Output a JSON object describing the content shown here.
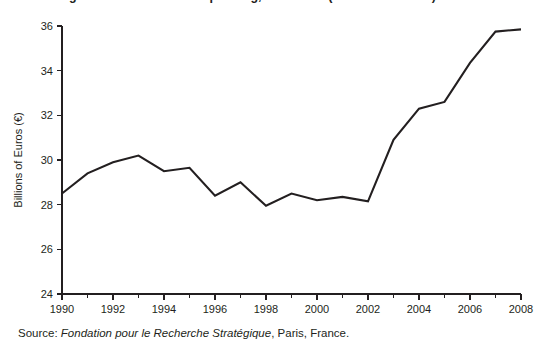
{
  "figure": {
    "title_partial": "Figure: French Defence Spending, 1990-2008 (Billions of Euros)",
    "background_color": "#ffffff",
    "line_color": "#231f20",
    "axis_color": "#231f20"
  },
  "source": {
    "label": "Source: ",
    "organization": "Fondation pour le Recherche Stratégique",
    "place": ", Paris, France."
  },
  "chart_data": {
    "type": "line",
    "title": "",
    "xlabel": "",
    "ylabel": "Billions of Euros (€)",
    "xlim": [
      1990,
      2008
    ],
    "ylim": [
      24,
      36
    ],
    "grid": false,
    "legend": false,
    "x_ticks_major": [
      1990,
      1992,
      1994,
      1996,
      1998,
      2000,
      2002,
      2004,
      2006,
      2008
    ],
    "x_ticks_minor": [
      1991,
      1993,
      1995,
      1997,
      1999,
      2001,
      2003,
      2005,
      2007
    ],
    "y_ticks": [
      24,
      26,
      28,
      30,
      32,
      34,
      36
    ],
    "x": [
      1990,
      1991,
      1992,
      1993,
      1994,
      1995,
      1996,
      1997,
      1998,
      1999,
      2000,
      2001,
      2002,
      2003,
      2004,
      2005,
      2006,
      2007,
      2008
    ],
    "values": [
      28.5,
      29.4,
      29.9,
      30.2,
      29.5,
      29.65,
      28.4,
      29.0,
      27.95,
      28.5,
      28.2,
      28.35,
      28.15,
      30.9,
      32.3,
      32.6,
      34.35,
      35.75,
      35.85
    ],
    "series": [
      {
        "name": "Defence spending",
        "values": [
          28.5,
          29.4,
          29.9,
          30.2,
          29.5,
          29.65,
          28.4,
          29.0,
          27.95,
          28.5,
          28.2,
          28.35,
          28.15,
          30.9,
          32.3,
          32.6,
          34.35,
          35.75,
          35.85
        ]
      }
    ]
  }
}
